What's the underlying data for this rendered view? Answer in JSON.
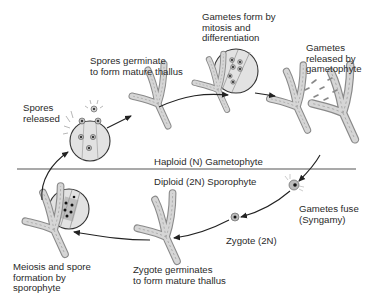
{
  "diagram": {
    "type": "life-cycle",
    "divider": {
      "upper_label": "Haploid (N) Gametophyte",
      "lower_label": "Diploid (2N) Sporophyte"
    },
    "stages": [
      {
        "id": "spores-released",
        "lines": [
          "Spores",
          "released"
        ]
      },
      {
        "id": "spores-germinate",
        "lines": [
          "Spores germinate",
          "to form mature thallus"
        ]
      },
      {
        "id": "gametes-form",
        "lines": [
          "Gametes form by",
          "mitosis and",
          "differentiation"
        ]
      },
      {
        "id": "gametes-released",
        "lines": [
          "Gametes",
          "released by",
          "gametophyte"
        ]
      },
      {
        "id": "gametes-fuse",
        "lines": [
          "Gametes fuse",
          "(Syngamy)"
        ]
      },
      {
        "id": "zygote",
        "lines": [
          "Zygote (2N)"
        ]
      },
      {
        "id": "zygote-germinates",
        "lines": [
          "Zygote germinates",
          "to form mature thallus"
        ]
      },
      {
        "id": "meiosis",
        "lines": [
          "Meiosis and spore",
          "formation by",
          "sporophyte"
        ]
      }
    ],
    "colors": {
      "line": "#333333",
      "thallus_fill": "#d6d6d6",
      "thallus_stroke": "#8a8a8a",
      "circle_fill": "#e2e2e2"
    }
  }
}
